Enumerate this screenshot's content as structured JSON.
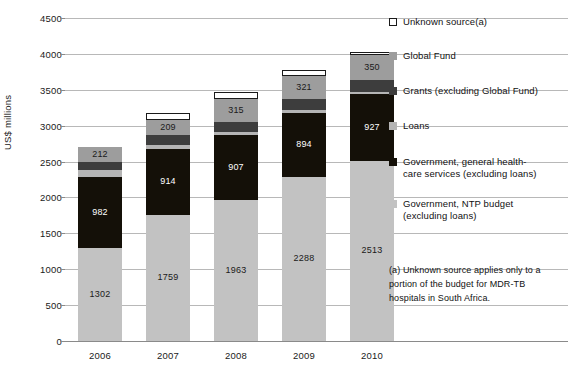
{
  "chart_data": {
    "type": "bar",
    "stacked": true,
    "title": "",
    "xlabel": "",
    "ylabel": "US$ millions",
    "ylim": [
      0,
      4500
    ],
    "ytick_step": 500,
    "yticks": [
      0,
      500,
      1000,
      1500,
      2000,
      2500,
      3000,
      3500,
      4000,
      4500
    ],
    "categories": [
      "2006",
      "2007",
      "2008",
      "2009",
      "2010"
    ],
    "grid": "horizontal",
    "legend_position": "right",
    "series": [
      {
        "name": "Government, NTP budget (excluding loans)",
        "color": "#c2c2c2",
        "values": [
          1302,
          1759,
          1963,
          2288,
          2513
        ],
        "labels": [
          "1302",
          "1759",
          "1963",
          "2288",
          "2513"
        ]
      },
      {
        "name": "Government, general health-care services (excluding loans)",
        "color": "#141008",
        "values": [
          982,
          914,
          907,
          894,
          927
        ],
        "labels": [
          "982",
          "914",
          "907",
          "894",
          "927"
        ]
      },
      {
        "name": "Loans",
        "color": "#b5b5b5",
        "values": [
          100,
          56,
          40,
          36,
          30
        ],
        "labels": [
          "",
          "",
          "",
          "",
          ""
        ]
      },
      {
        "name": "Grants (excluding Global Fund)",
        "color": "#3d3d3d",
        "values": [
          104,
          135,
          140,
          150,
          160
        ],
        "labels": [
          "",
          "",
          "",
          "",
          ""
        ]
      },
      {
        "name": "Global Fund",
        "color": "#9d9d9d",
        "values": [
          212,
          209,
          315,
          321,
          350
        ],
        "labels": [
          "212",
          "209",
          "315",
          "321",
          "350"
        ]
      },
      {
        "name": "Unknown source(a)",
        "color": "#ffffff",
        "values": [
          0,
          107,
          105,
          91,
          50
        ],
        "labels": [
          "",
          "",
          "",
          "",
          ""
        ]
      }
    ],
    "totals": [
      2700,
      3180,
      3470,
      3780,
      4030
    ],
    "annotation": "(a) Unknown source applies only to a portion of the budget for MDR-TB hospitals in South Africa."
  },
  "legend": {
    "items": [
      {
        "label": "Unknown source(a)",
        "color": "#ffffff",
        "border": "#1a1a1a"
      },
      {
        "label": "Global Fund",
        "color": "#9d9d9d",
        "border": "#9d9d9d"
      },
      {
        "label": "Grants (excluding Global Fund)",
        "color": "#3d3d3d",
        "border": "#3d3d3d"
      },
      {
        "label": "Loans",
        "color": "#b5b5b5",
        "border": "#b5b5b5"
      },
      {
        "label": "Government, general health-\ncare services (excluding loans)",
        "color": "#141008",
        "border": "#141008"
      },
      {
        "label": "Government, NTP budget\n(excluding loans)",
        "color": "#c2c2c2",
        "border": "#c2c2c2"
      }
    ]
  },
  "axis": {
    "y_title": "US$ millions"
  },
  "footnote": {
    "text": "(a) Unknown source applies only to a portion of the budget for MDR-TB hospitals in South Africa."
  }
}
